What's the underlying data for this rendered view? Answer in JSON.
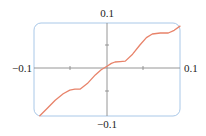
{
  "chart_data": {
    "type": "line",
    "title": "",
    "xlabel": "",
    "ylabel": "",
    "xlim": [
      -0.1,
      0.1
    ],
    "ylim": [
      -0.1,
      0.1
    ],
    "grid": false,
    "legend": null,
    "tick_labels": {
      "x_left": "−0.1",
      "x_right": "0.1",
      "y_top": "0.1",
      "y_bottom": "−0.1"
    },
    "minor_ticks": {
      "x": [
        -0.05,
        0.05
      ],
      "y": [
        -0.05,
        0.05
      ]
    },
    "series": [
      {
        "name": "f(x)",
        "color": "#e8836a",
        "x": [
          -0.092,
          -0.082,
          -0.071,
          -0.06,
          -0.051,
          -0.044,
          -0.037,
          -0.027,
          -0.016,
          -0.008,
          0.0,
          0.006,
          0.011,
          0.018,
          0.025,
          0.035,
          0.045,
          0.054,
          0.062,
          0.073,
          0.084,
          0.092,
          0.1
        ],
        "y": [
          -0.104,
          -0.088,
          -0.07,
          -0.056,
          -0.048,
          -0.046,
          -0.046,
          -0.034,
          -0.015,
          -0.004,
          0.004,
          0.01,
          0.013,
          0.014,
          0.015,
          0.03,
          0.05,
          0.066,
          0.074,
          0.076,
          0.076,
          0.082,
          0.091
        ]
      }
    ]
  },
  "colors": {
    "frame": "#a9c8e8",
    "axis": "#8a8a8a",
    "curve": "#e8836a"
  }
}
